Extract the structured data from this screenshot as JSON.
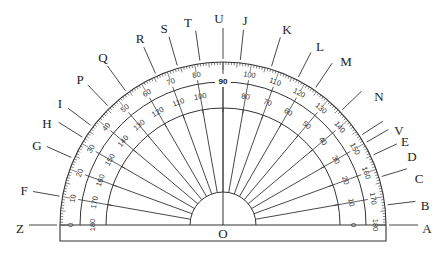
{
  "diagram": {
    "type": "protractor",
    "center_label": "O",
    "center": {
      "x": 223,
      "y": 225
    },
    "radii": {
      "outer_ticks": 163,
      "outer_scale": 143,
      "inner_scale": 117,
      "hub": 33
    },
    "colors": {
      "stroke": "#333333",
      "text": "#222222",
      "background": "#ffffff"
    },
    "outer_scale_numbers": [
      "0",
      "10",
      "20",
      "30",
      "40",
      "50",
      "60",
      "70",
      "80",
      "90",
      "100",
      "110",
      "120",
      "130",
      "140",
      "150",
      "160",
      "170",
      "180"
    ],
    "inner_scale_numbers": [
      "180",
      "170",
      "160",
      "150",
      "140",
      "130",
      "120",
      "110",
      "100",
      "90",
      "80",
      "70",
      "60",
      "50",
      "40",
      "30",
      "20",
      "10",
      "0"
    ],
    "highlight_label": "90",
    "rays_degrees": [
      10,
      20,
      30,
      40,
      50,
      60,
      70,
      80,
      90,
      100,
      110,
      120,
      130,
      140,
      150,
      160,
      170
    ],
    "points": [
      {
        "label": "A",
        "x": 427,
        "y": 229,
        "angle": 0
      },
      {
        "label": "B",
        "x": 425,
        "y": 206,
        "angle": 7
      },
      {
        "label": "C",
        "x": 419,
        "y": 179,
        "angle": 17
      },
      {
        "label": "D",
        "x": 412,
        "y": 157,
        "angle": 25
      },
      {
        "label": "E",
        "x": 405,
        "y": 142,
        "angle": 30
      },
      {
        "label": "V",
        "x": 399,
        "y": 131,
        "angle": 33
      },
      {
        "label": "N",
        "x": 379,
        "y": 97,
        "angle": 44
      },
      {
        "label": "M",
        "x": 346,
        "y": 62,
        "angle": 56
      },
      {
        "label": "L",
        "x": 320,
        "y": 47,
        "angle": 63
      },
      {
        "label": "K",
        "x": 287,
        "y": 30,
        "angle": 73
      },
      {
        "label": "J",
        "x": 245,
        "y": 21,
        "angle": 84
      },
      {
        "label": "U",
        "x": 219,
        "y": 19,
        "angle": 90
      },
      {
        "label": "T",
        "x": 188,
        "y": 23,
        "angle": 98
      },
      {
        "label": "S",
        "x": 164,
        "y": 29,
        "angle": 106
      },
      {
        "label": "R",
        "x": 140,
        "y": 39,
        "angle": 114
      },
      {
        "label": "Q",
        "x": 103,
        "y": 58,
        "angle": 126
      },
      {
        "label": "P",
        "x": 80,
        "y": 80,
        "angle": 134
      },
      {
        "label": "I",
        "x": 60,
        "y": 104,
        "angle": 143
      },
      {
        "label": "H",
        "x": 47,
        "y": 124,
        "angle": 148
      },
      {
        "label": "G",
        "x": 37,
        "y": 146,
        "angle": 156
      },
      {
        "label": "F",
        "x": 24,
        "y": 191,
        "angle": 170
      },
      {
        "label": "Z",
        "x": 20,
        "y": 229,
        "angle": 180
      }
    ]
  }
}
